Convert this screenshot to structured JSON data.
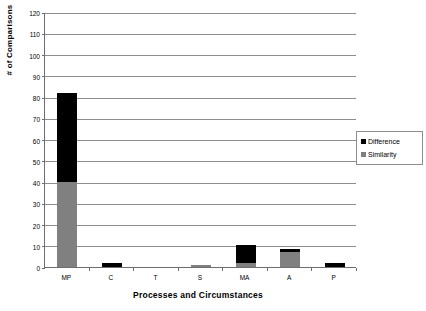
{
  "chart_data": {
    "type": "bar",
    "subtype": "stacked-column",
    "title": "",
    "xlabel": "Processes and Circumstances",
    "ylabel": "# of Comparisons",
    "categories": [
      "MP",
      "C",
      "T",
      "S",
      "MA",
      "A",
      "P"
    ],
    "series": [
      {
        "name": "Similarity",
        "color": "#808080",
        "values": [
          40,
          0,
          0,
          1,
          2,
          7,
          0
        ]
      },
      {
        "name": "Difference",
        "color": "#000000",
        "values": [
          42,
          2,
          0,
          0,
          8.5,
          1.5,
          2
        ]
      }
    ],
    "stack_order": [
      "Similarity",
      "Difference"
    ],
    "totals": [
      82,
      2,
      0,
      1,
      10.5,
      8.5,
      2
    ],
    "ylim": [
      0,
      120
    ],
    "ytick_step": 10,
    "yticks": [
      0,
      10,
      20,
      30,
      40,
      50,
      60,
      70,
      80,
      90,
      100,
      110,
      120
    ],
    "ytick_labels": [
      "0",
      "10",
      "20",
      "30",
      "40",
      "50",
      "60",
      "70",
      "80",
      "90",
      "100",
      "110",
      "120"
    ],
    "grid": true,
    "grid_axis": "y",
    "legend": {
      "position": "right",
      "entries": [
        {
          "label": "Difference",
          "color": "#000000"
        },
        {
          "label": "Similarity",
          "color": "#808080"
        }
      ]
    },
    "colors": {
      "difference": "#000000",
      "similarity": "#808080",
      "axis": "#6e6e6e",
      "gridline": "#8d8d8d",
      "background": "#ffffff"
    }
  }
}
